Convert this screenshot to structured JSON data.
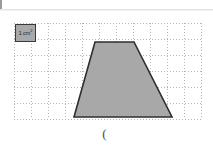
{
  "page": {
    "background_color": "#ffffff",
    "width": 213,
    "height": 149
  },
  "top_rule": {
    "name": "header-rule",
    "color": "#e2e2e2"
  },
  "legend": {
    "label_text": "1 cm",
    "label_superscript": "2",
    "swatch_fill": "#a9a9a9",
    "swatch_border": "#3a3a3a"
  },
  "grid": {
    "columns": 11,
    "rows": 6,
    "cell_width": 17,
    "cell_height": 16,
    "line_color": "#b3b3c4",
    "style": "dotted",
    "left": 14,
    "top": 23,
    "width": 187,
    "height": 96
  },
  "shape": {
    "name": "trapezoid",
    "fill": "#a8a8a8",
    "stroke": "#2e2e2e",
    "stroke_width": 1.6,
    "points": "95,42 134,42 172,117 74,117",
    "vertices": [
      {
        "label": "top-left",
        "x": 95,
        "y": 42
      },
      {
        "label": "top-right",
        "x": 134,
        "y": 42
      },
      {
        "label": "bottom-right",
        "x": 172,
        "y": 117
      },
      {
        "label": "bottom-left",
        "x": 74,
        "y": 117
      }
    ]
  },
  "caption": {
    "text": "("
  }
}
